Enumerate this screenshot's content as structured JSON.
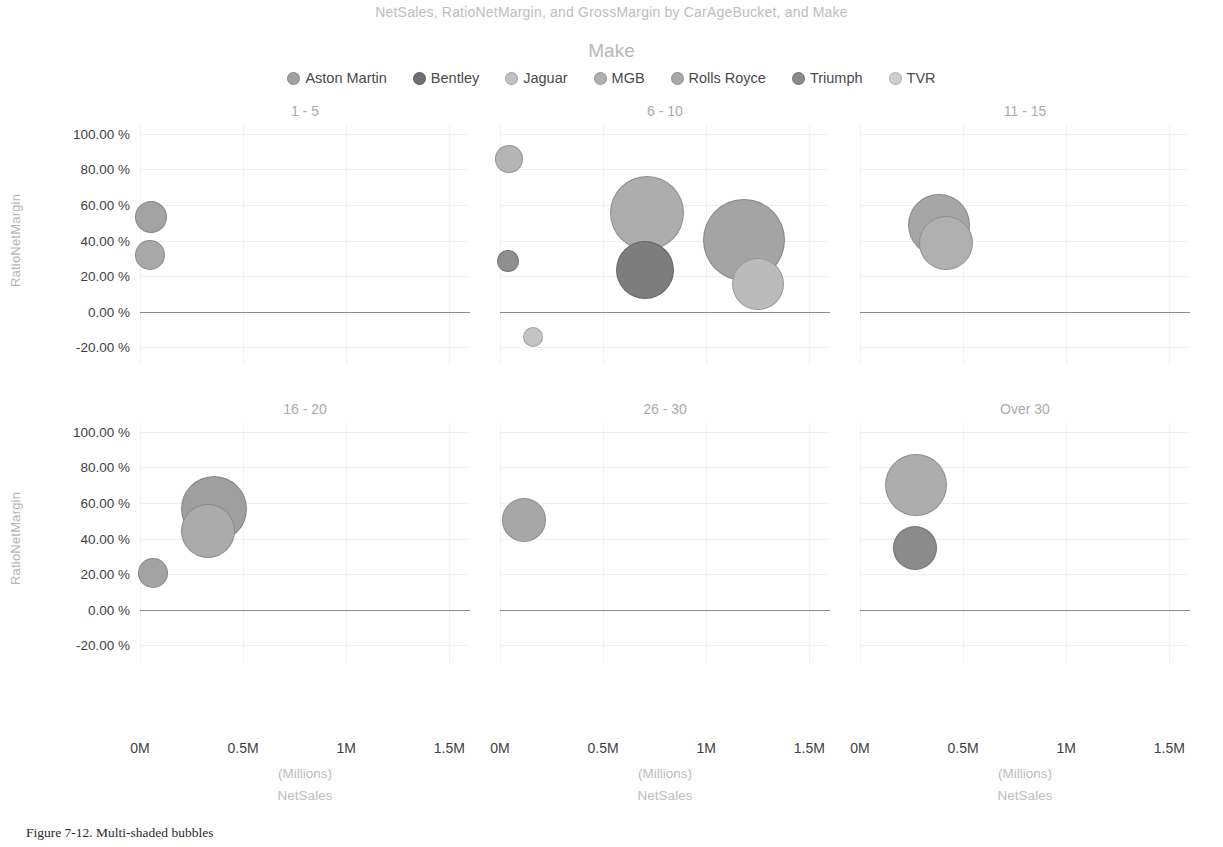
{
  "chart_data": {
    "type": "scatter",
    "title": "NetSales, RatioNetMargin, and GrossMargin by CarAgeBucket, and Make",
    "xlabel": "NetSales",
    "xunit": "(Millions)",
    "ylabel": "RatioNetMargin",
    "xlim": [
      0,
      1.6
    ],
    "ylim": [
      -0.3,
      1.05
    ],
    "xticks": [
      "0M",
      "0.5M",
      "1M",
      "1.5M"
    ],
    "xtick_values": [
      0,
      0.5,
      1,
      1.5
    ],
    "yticks": [
      "100.00 %",
      "80.00 %",
      "60.00 %",
      "40.00 %",
      "20.00 %",
      "0.00 %",
      "-20.00 %"
    ],
    "ytick_values": [
      1.0,
      0.8,
      0.6,
      0.4,
      0.2,
      0.0,
      -0.2
    ],
    "grid": true,
    "legend_position": "top",
    "size_encoding": "GrossMargin",
    "facet_variable": "CarAgeBucket",
    "series_variable": "Make",
    "legend": {
      "title": "Make",
      "entries": [
        {
          "name": "Aston Martin",
          "color": "#a0a0a0"
        },
        {
          "name": "Bentley",
          "color": "#6f6f6f"
        },
        {
          "name": "Jaguar",
          "color": "#c2c2c2"
        },
        {
          "name": "MGB",
          "color": "#b0b0b0"
        },
        {
          "name": "Rolls Royce",
          "color": "#a8a8a8"
        },
        {
          "name": "Triumph",
          "color": "#8a8a8a"
        },
        {
          "name": "TVR",
          "color": "#cfcfcf"
        }
      ]
    },
    "panels": [
      {
        "label": "1 - 5",
        "row": 0,
        "col": 0,
        "points": [
          {
            "make": "Aston Martin",
            "netsales": 0.055,
            "ratio_net_margin": 0.53,
            "size": 16,
            "color": "#a3a3a3"
          },
          {
            "make": "Aston Martin",
            "netsales": 0.05,
            "ratio_net_margin": 0.32,
            "size": 15,
            "color": "#a8a8a8"
          }
        ]
      },
      {
        "label": "6 - 10",
        "row": 0,
        "col": 1,
        "points": [
          {
            "make": "TVR",
            "netsales": 0.045,
            "ratio_net_margin": 0.86,
            "size": 14,
            "color": "#b5b5b5"
          },
          {
            "make": "Bentley",
            "netsales": 0.04,
            "ratio_net_margin": 0.285,
            "size": 11,
            "color": "#8f8f8f"
          },
          {
            "make": "Rolls Royce",
            "netsales": 0.715,
            "ratio_net_margin": 0.555,
            "size": 37,
            "color": "#adadad"
          },
          {
            "make": "Bentley",
            "netsales": 0.705,
            "ratio_net_margin": 0.235,
            "size": 29,
            "color": "#7d7d7d"
          },
          {
            "make": "Rolls Royce",
            "netsales": 1.185,
            "ratio_net_margin": 0.405,
            "size": 41,
            "color": "#a4a4a4"
          },
          {
            "make": "Jaguar",
            "netsales": 1.25,
            "ratio_net_margin": 0.155,
            "size": 26,
            "color": "#bbbbbb"
          },
          {
            "make": "TVR",
            "netsales": 0.16,
            "ratio_net_margin": -0.145,
            "size": 10,
            "color": "#c4c4c4"
          }
        ]
      },
      {
        "label": "11 - 15",
        "row": 0,
        "col": 2,
        "points": [
          {
            "make": "Rolls Royce",
            "netsales": 0.385,
            "ratio_net_margin": 0.49,
            "size": 31,
            "color": "#a6a6a6"
          },
          {
            "make": "Rolls Royce",
            "netsales": 0.415,
            "ratio_net_margin": 0.385,
            "size": 27,
            "color": "#b0b0b0"
          }
        ]
      },
      {
        "label": "16 - 20",
        "row": 1,
        "col": 0,
        "points": [
          {
            "make": "Rolls Royce",
            "netsales": 0.36,
            "ratio_net_margin": 0.565,
            "size": 33,
            "color": "#9f9f9f"
          },
          {
            "make": "Rolls Royce",
            "netsales": 0.33,
            "ratio_net_margin": 0.445,
            "size": 27,
            "color": "#ababab"
          },
          {
            "make": "Aston Martin",
            "netsales": 0.065,
            "ratio_net_margin": 0.205,
            "size": 15,
            "color": "#a3a3a3"
          }
        ]
      },
      {
        "label": "26 - 30",
        "row": 1,
        "col": 1,
        "points": [
          {
            "make": "Rolls Royce",
            "netsales": 0.115,
            "ratio_net_margin": 0.505,
            "size": 22,
            "color": "#a7a7a7"
          }
        ]
      },
      {
        "label": "Over 30",
        "row": 1,
        "col": 2,
        "points": [
          {
            "make": "Rolls Royce",
            "netsales": 0.27,
            "ratio_net_margin": 0.7,
            "size": 31,
            "color": "#adadad"
          },
          {
            "make": "Triumph",
            "netsales": 0.265,
            "ratio_net_margin": 0.345,
            "size": 22,
            "color": "#8b8b8b"
          }
        ]
      }
    ]
  },
  "caption": "Figure 7-12.  Multi-shaded bubbles"
}
